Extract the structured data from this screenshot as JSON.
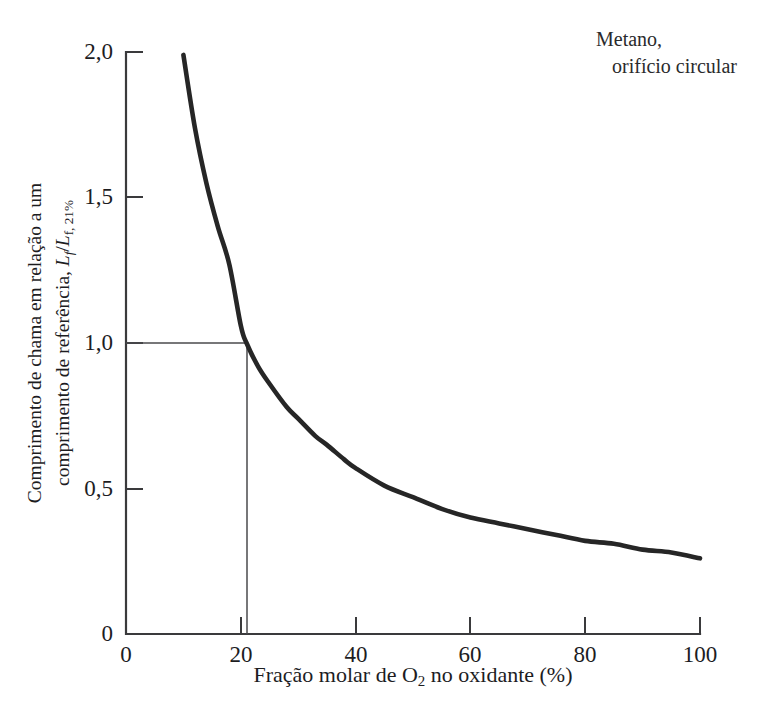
{
  "annotation": {
    "line_1": "Metano,",
    "line_2": "orifício circular"
  },
  "axis_titles": {
    "x": "Fração molar de O",
    "x_sub": "2",
    "x_tail": " no oxidante (%)",
    "y_line_1": "Comprimento de chama em relação a um",
    "y_line_2_prefix": "comprimento de referência, ",
    "y_sym_num": "L",
    "y_sym_num_sub": "f",
    "y_sym_slash": "/",
    "y_sym_den": "L",
    "y_sym_den_sub": "f, 21%"
  },
  "ticks": {
    "y": [
      "2,0",
      "1,5",
      "1,0",
      "0,5",
      "0"
    ],
    "x": [
      "0",
      "20",
      "40",
      "60",
      "80",
      "100"
    ]
  },
  "colors": {
    "background": "#ffffff",
    "ink": "#1d1d1f",
    "curve": "#262626",
    "axis": "#3a3a3c",
    "reference_line": "#4a4a4c"
  },
  "chart_data": {
    "type": "line",
    "title": "",
    "subtitle": "",
    "annotation": "Metano, orifício circular",
    "xlabel": "Fração molar de O2 no oxidante (%)",
    "ylabel": "Comprimento de chama em relação a um comprimento de referência, Lf/Lf, 21%",
    "xlim": [
      0,
      100
    ],
    "ylim": [
      0,
      2.0
    ],
    "xticks": [
      0,
      20,
      40,
      60,
      80,
      100
    ],
    "yticks": [
      0,
      0.5,
      1.0,
      1.5,
      2.0
    ],
    "ytick_labels": [
      "0",
      "0,5",
      "1,0",
      "1,5",
      "2,0"
    ],
    "grid": false,
    "legend": false,
    "decimal_separator": ",",
    "series": [
      {
        "name": "Comprimento de chama normalizado",
        "x": [
          10,
          12,
          14,
          16,
          18,
          20,
          21,
          23,
          25,
          28,
          30,
          33,
          35,
          38,
          40,
          45,
          50,
          55,
          60,
          65,
          70,
          75,
          80,
          85,
          90,
          95,
          100
        ],
        "values": [
          1.99,
          1.74,
          1.55,
          1.4,
          1.27,
          1.06,
          1.0,
          0.92,
          0.86,
          0.78,
          0.74,
          0.68,
          0.65,
          0.6,
          0.57,
          0.51,
          0.47,
          0.43,
          0.4,
          0.38,
          0.36,
          0.34,
          0.32,
          0.31,
          0.29,
          0.28,
          0.26
        ]
      }
    ],
    "reference_lines": [
      {
        "name": "reference-horizontal",
        "orientation": "horizontal",
        "y": 1.0,
        "x_from": 0,
        "x_to": 21
      },
      {
        "name": "reference-vertical",
        "orientation": "vertical",
        "x": 21,
        "y_from": 0,
        "y_to": 1.0
      }
    ],
    "reference_point": {
      "x": 21,
      "y": 1.0
    }
  }
}
